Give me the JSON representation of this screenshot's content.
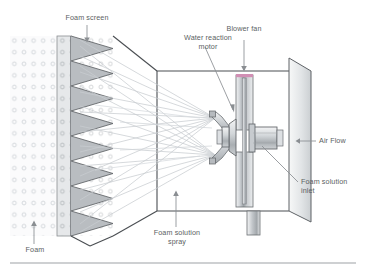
{
  "diagram": {
    "title_text_visible": false,
    "labels": {
      "foam_screen": "Foam screen",
      "blower_fan": "Blower fan",
      "water_reaction_motor_line1": "Water reaction",
      "water_reaction_motor_line2": "motor",
      "air_flow": "Air Flow",
      "foam_solution_inlet_line1": "Foam solution",
      "foam_solution_inlet_line2": "inlet",
      "foam_solution_spray_line1": "Foam solution",
      "foam_solution_spray_line2": "spray",
      "foam": "Foam"
    },
    "icons": {
      "arrow_down_foam_screen": "arrow-down-icon",
      "arrow_down_blower_fan": "arrow-down-icon",
      "arrow_up_foam": "arrow-up-icon",
      "arrow_up_spray": "arrow-up-icon",
      "arrow_left_air_flow": "arrow-left-icon",
      "leader_water_motor": "leader-line-icon",
      "leader_foam_inlet": "leader-line-icon"
    },
    "colors": {
      "text": "#5b5f63",
      "stroke_dark": "#4a4e52",
      "stroke_mid": "#8a8e92",
      "stroke_light": "#c2c6ca",
      "foam_dot": "#d3d7db",
      "tooth_fill": "#b9bdc1",
      "screen_fill": "#e6e8ea",
      "metal_light": "#eceef0",
      "metal_mid": "#c8ccd0",
      "metal_dark": "#9aa0a4",
      "accent_pink": "#d18fb4",
      "rule": "#9ea2a6",
      "background": "#ffffff"
    },
    "structure": {
      "foam_dot_grid": {
        "cols": 7,
        "rows": 15,
        "dot_radius_px": 1.9
      },
      "screen_band": {
        "x": 57,
        "width": 14
      },
      "sawtooth": {
        "teeth": 8,
        "x_base": 71,
        "tip_x": 113
      },
      "fan_blades": 2,
      "nozzle_arms": 2,
      "spray_origin_points": 2,
      "duct_shape": "tapered-perspective-box",
      "bottom_rule_y": 263
    }
  }
}
